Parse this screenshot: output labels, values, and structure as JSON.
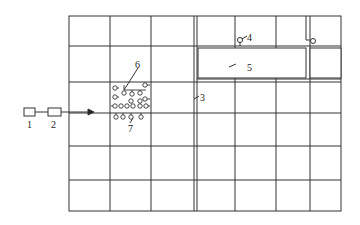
{
  "diagram": {
    "type": "schematic-grid",
    "labels": {
      "l1": "1",
      "l2": "2",
      "l3": "3",
      "l4": "4",
      "l5": "5",
      "l6": "6",
      "l7": "7"
    },
    "grid": {
      "vertical_lines_x": [
        69,
        110,
        151,
        194,
        235,
        276,
        310,
        341
      ],
      "horizontal_lines_y": [
        16,
        46,
        82,
        113,
        146,
        180,
        211
      ]
    },
    "colors": {
      "line": "#222222",
      "background": "#ffffff"
    }
  }
}
